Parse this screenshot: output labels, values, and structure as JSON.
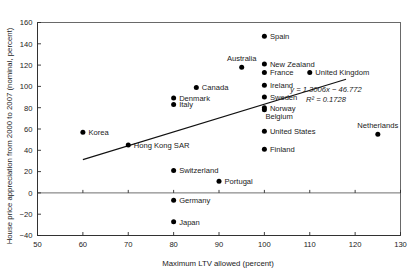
{
  "chart_data": {
    "type": "scatter",
    "title": "",
    "xlabel": "Maximum LTV allowed (percent)",
    "ylabel": "House price appreciation from 2000 to 2007 (nominal, percent)",
    "xlim": [
      50,
      130
    ],
    "ylim": [
      -40,
      160
    ],
    "xticks": [
      50,
      60,
      70,
      80,
      90,
      100,
      110,
      120,
      130
    ],
    "yticks": [
      -40,
      -20,
      0,
      20,
      40,
      60,
      80,
      100,
      120,
      140,
      160
    ],
    "grid": false,
    "legend": "none",
    "zero_line": true,
    "points": [
      {
        "label": "Korea",
        "x": 60,
        "y": 57,
        "label_pos": "right"
      },
      {
        "label": "Hong Kong SAR",
        "x": 70,
        "y": 45,
        "label_pos": "right"
      },
      {
        "label": "Denmark",
        "x": 80,
        "y": 89,
        "label_pos": "right"
      },
      {
        "label": "Italy",
        "x": 80,
        "y": 83,
        "label_pos": "right"
      },
      {
        "label": "Switzerland",
        "x": 80,
        "y": 21,
        "label_pos": "right"
      },
      {
        "label": "Germany",
        "x": 80,
        "y": -7,
        "label_pos": "right"
      },
      {
        "label": "Japan",
        "x": 80,
        "y": -27,
        "label_pos": "right"
      },
      {
        "label": "Canada",
        "x": 85,
        "y": 99,
        "label_pos": "right"
      },
      {
        "label": "Portugal",
        "x": 90,
        "y": 11,
        "label_pos": "right"
      },
      {
        "label": "Australia",
        "x": 95,
        "y": 118,
        "label_pos": "above"
      },
      {
        "label": "Spain",
        "x": 100,
        "y": 147,
        "label_pos": "right"
      },
      {
        "label": "New Zealand",
        "x": 100,
        "y": 121,
        "label_pos": "right"
      },
      {
        "label": "France",
        "x": 100,
        "y": 113,
        "label_pos": "right"
      },
      {
        "label": "Ireland",
        "x": 100,
        "y": 101,
        "label_pos": "right"
      },
      {
        "label": "Sweden",
        "x": 100,
        "y": 90,
        "label_pos": "right"
      },
      {
        "label": "Norway",
        "x": 100,
        "y": 80,
        "label_pos": "right"
      },
      {
        "label": "Belgium",
        "x": 100,
        "y": 78,
        "label_pos": "below-right"
      },
      {
        "label": "United States",
        "x": 100,
        "y": 58,
        "label_pos": "right"
      },
      {
        "label": "Finland",
        "x": 100,
        "y": 41,
        "label_pos": "right"
      },
      {
        "label": "United Kingdom",
        "x": 110,
        "y": 113,
        "label_pos": "right"
      },
      {
        "label": "Netherlands",
        "x": 125,
        "y": 55,
        "label_pos": "above"
      }
    ],
    "trendline": {
      "slope": 1.3006,
      "intercept": -46.772,
      "equation": "y = 1.3006x − 46.772",
      "r_squared_label": "R² = 0.1728",
      "r_squared": 0.1728,
      "x_start": 60,
      "x_end": 118
    }
  }
}
